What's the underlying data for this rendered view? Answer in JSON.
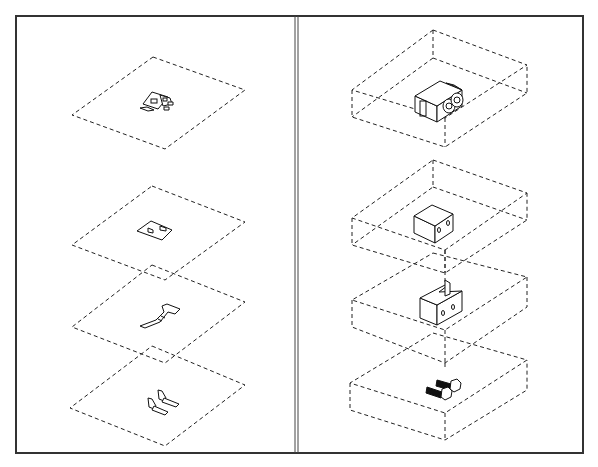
{
  "figure": {
    "colors": {
      "line": "#111111",
      "frame": "#333333",
      "background": "#ffffff"
    },
    "left_panel": {
      "label": "2D layers",
      "layers": [
        {
          "id": "layer-1",
          "content": "combined assembly outline"
        },
        {
          "id": "layer-2",
          "content": "block outline with two holes"
        },
        {
          "id": "layer-3",
          "content": "bracket (L-shape) outline"
        },
        {
          "id": "layer-4",
          "content": "two bolts outline"
        }
      ]
    },
    "right_panel": {
      "label": "3D parts",
      "parts": [
        {
          "id": "part-1",
          "content": "assembled block with bracket and bolts"
        },
        {
          "id": "part-2",
          "content": "block with two holes"
        },
        {
          "id": "part-3",
          "content": "L-bracket with two holes"
        },
        {
          "id": "part-4",
          "content": "two hex bolts"
        }
      ]
    }
  }
}
